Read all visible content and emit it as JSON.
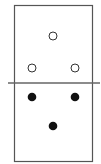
{
  "domino": {
    "top_half": {
      "pips": 3,
      "style": "hollow"
    },
    "bottom_half": {
      "pips": 3,
      "style": "filled"
    }
  },
  "colors": {
    "border": "#555555",
    "pip_fill": "#111111",
    "background": "#ffffff"
  }
}
